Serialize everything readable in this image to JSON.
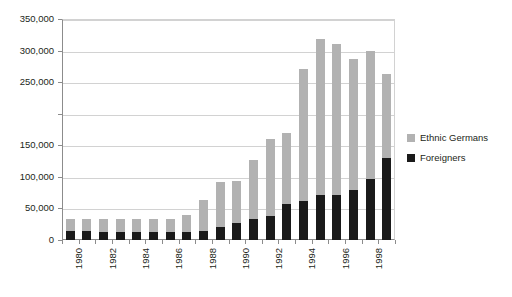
{
  "chart_data": {
    "type": "bar",
    "subtype": "stacked-bar",
    "title": "",
    "subtitle": "",
    "xlabel": "",
    "ylabel": "",
    "ylim": [
      0,
      350000
    ],
    "ytick_step": 50000,
    "grid": true,
    "legend_position": "right",
    "categories": [
      "1980",
      "1981",
      "1982",
      "1983",
      "1984",
      "1985",
      "1986",
      "1987",
      "1988",
      "1989",
      "1990",
      "1991",
      "1992",
      "1993",
      "1994",
      "1995",
      "1996",
      "1997",
      "1998",
      "1999"
    ],
    "xtick_labels": [
      "1980",
      "",
      "1982",
      "",
      "1984",
      "",
      "1986",
      "",
      "1988",
      "",
      "1990",
      "",
      "1992",
      "",
      "1994",
      "",
      "1996",
      "",
      "1998",
      ""
    ],
    "ytick_labels": [
      "0",
      "50,000",
      "100,000",
      "150,000",
      "",
      "250,000",
      "300,000",
      "350,000"
    ],
    "ytick_values": [
      0,
      50000,
      100000,
      150000,
      200000,
      250000,
      300000,
      350000
    ],
    "note_missing_ytick_label": "200,000",
    "series": [
      {
        "name": "Foreigners",
        "color": "#1a1a1a",
        "stack_order": "bottom",
        "values": [
          14000,
          14000,
          13000,
          12000,
          12000,
          12000,
          12000,
          13000,
          14000,
          20000,
          27000,
          33000,
          38000,
          57000,
          62000,
          72000,
          72000,
          80000,
          96000,
          130000
        ]
      },
      {
        "name": "Ethnic Germans",
        "color": "#b2b2b2",
        "stack_order": "top",
        "values": [
          20000,
          19000,
          20000,
          21000,
          21000,
          21000,
          22000,
          27000,
          49000,
          72000,
          66000,
          94000,
          122000,
          113000,
          209000,
          247000,
          238000,
          206000,
          204000,
          133000
        ]
      }
    ],
    "totals": [
      34000,
      33000,
      33000,
      33000,
      33000,
      33000,
      34000,
      40000,
      63000,
      92000,
      93000,
      127000,
      160000,
      170000,
      271000,
      319000,
      310000,
      286000,
      300000,
      263000
    ]
  },
  "legend": {
    "entries": [
      {
        "label": "Ethnic Germans",
        "color": "#b2b2b2",
        "swatch_name": "legend-swatch-ethnic-germans"
      },
      {
        "label": "Foreigners",
        "color": "#1a1a1a",
        "swatch_name": "legend-swatch-foreigners"
      }
    ]
  }
}
